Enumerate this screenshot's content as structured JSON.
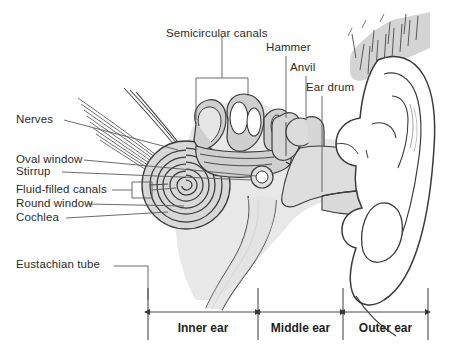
{
  "figure": {
    "background_color": "#ffffff",
    "line_color": "#3a3a3a",
    "fill_light": "#e8e8e8",
    "fill_mid": "#d2d2d2",
    "fill_dark": "#bdbdbd",
    "text_color": "#2b2b2b"
  },
  "labels": {
    "semicircular_canals": "Semicircular canals",
    "hammer": "Hammer",
    "anvil": "Anvil",
    "ear_drum": "Ear drum",
    "nerves": "Nerves",
    "oval_window": "Oval window",
    "stirrup": "Stirrup",
    "fluid_filled_canals": "Fluid-filled canals",
    "round_window": "Round window",
    "cochlea": "Cochlea",
    "eustachian_tube": "Eustachian tube"
  },
  "regions": {
    "inner_ear": "Inner ear",
    "middle_ear": "Middle ear",
    "outer_ear": "Outer ear"
  },
  "icon_names": [
    "cochlea-spiral-icon",
    "semicircular-canals-icon",
    "hammer-bone-icon",
    "anvil-bone-icon",
    "stirrup-bone-icon",
    "ear-drum-icon",
    "eustachian-tube-icon",
    "nerve-bundle-icon",
    "pinna-outer-ear-icon",
    "hair-strands-icon",
    "double-arrow-icon"
  ]
}
